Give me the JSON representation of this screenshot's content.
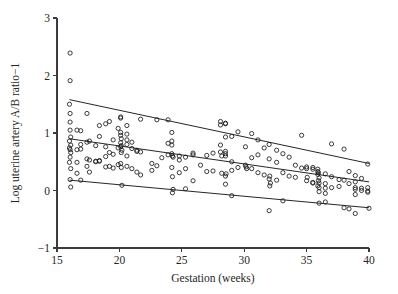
{
  "chart_data": {
    "type": "scatter",
    "title": "",
    "xlabel": "Gestation (weeks)",
    "ylabel": "Log uterine artery A/B ratio−1",
    "xlim": [
      15,
      40
    ],
    "ylim": [
      -1,
      3
    ],
    "xticks": [
      15,
      20,
      25,
      30,
      35,
      40
    ],
    "yticks": [
      -1,
      0,
      1,
      2,
      3
    ],
    "xtick_labels": [
      "15",
      "20",
      "25",
      "30",
      "35",
      "40"
    ],
    "ytick_labels": [
      "−1",
      "0",
      "1",
      "2",
      "3"
    ],
    "grid": false,
    "legend": null,
    "marker": "open-circle",
    "marker_color": "#1a1a1a",
    "line_color": "#1a1a1a",
    "reference_lines": [
      {
        "name": "upper-centile-line",
        "x": [
          16.0,
          40.0
        ],
        "y": [
          1.58,
          0.47
        ]
      },
      {
        "name": "median-line",
        "x": [
          16.0,
          40.0
        ],
        "y": [
          0.9,
          0.15
        ]
      },
      {
        "name": "lower-centile-line",
        "x": [
          16.0,
          40.0
        ],
        "y": [
          0.18,
          -0.3
        ]
      }
    ],
    "points": [
      [
        16.05,
        2.39
      ],
      [
        16.05,
        1.91
      ],
      [
        16.0,
        1.5
      ],
      [
        16.05,
        1.34
      ],
      [
        16.05,
        1.19
      ],
      [
        16.05,
        1.05
      ],
      [
        16.1,
        0.93
      ],
      [
        16.0,
        0.86
      ],
      [
        16.1,
        0.79
      ],
      [
        16.0,
        0.74
      ],
      [
        16.05,
        0.71
      ],
      [
        16.1,
        0.66
      ],
      [
        16.05,
        0.58
      ],
      [
        16.0,
        0.49
      ],
      [
        16.1,
        0.38
      ],
      [
        16.05,
        0.19
      ],
      [
        16.1,
        0.06
      ],
      [
        16.6,
        1.05
      ],
      [
        16.6,
        0.71
      ],
      [
        16.6,
        0.49
      ],
      [
        16.6,
        0.3
      ],
      [
        16.9,
        1.04
      ],
      [
        16.9,
        0.8
      ],
      [
        16.9,
        0.72
      ],
      [
        16.9,
        0.18
      ],
      [
        17.4,
        1.34
      ],
      [
        17.4,
        0.84
      ],
      [
        17.4,
        0.55
      ],
      [
        17.4,
        0.42
      ],
      [
        17.6,
        0.86
      ],
      [
        17.6,
        0.53
      ],
      [
        17.6,
        0.32
      ],
      [
        18.1,
        0.78
      ],
      [
        18.1,
        0.51
      ],
      [
        18.1,
        0.5
      ],
      [
        18.4,
        1.13
      ],
      [
        18.4,
        0.94
      ],
      [
        18.4,
        0.52
      ],
      [
        18.4,
        0.51
      ],
      [
        18.9,
        1.16
      ],
      [
        18.9,
        0.76
      ],
      [
        18.9,
        0.59
      ],
      [
        18.9,
        0.41
      ],
      [
        19.2,
        1.2
      ],
      [
        19.2,
        0.66
      ],
      [
        19.2,
        0.42
      ],
      [
        19.5,
        0.88
      ],
      [
        19.5,
        0.63
      ],
      [
        19.5,
        0.39
      ],
      [
        19.9,
        1.08
      ],
      [
        19.9,
        0.74
      ],
      [
        19.9,
        0.45
      ],
      [
        20.1,
        1.28
      ],
      [
        20.1,
        1.26
      ],
      [
        20.1,
        1.01
      ],
      [
        20.1,
        0.96
      ],
      [
        20.15,
        0.9
      ],
      [
        20.1,
        0.83
      ],
      [
        20.15,
        0.78
      ],
      [
        20.1,
        0.76
      ],
      [
        20.2,
        0.7
      ],
      [
        20.15,
        0.66
      ],
      [
        20.1,
        0.47
      ],
      [
        20.15,
        0.4
      ],
      [
        20.2,
        0.09
      ],
      [
        20.6,
        1.13
      ],
      [
        20.6,
        0.98
      ],
      [
        20.6,
        0.88
      ],
      [
        20.6,
        0.8
      ],
      [
        20.6,
        0.6
      ],
      [
        20.6,
        0.42
      ],
      [
        21.0,
        0.84
      ],
      [
        21.0,
        0.73
      ],
      [
        21.0,
        0.38
      ],
      [
        21.4,
        0.7
      ],
      [
        21.4,
        0.68
      ],
      [
        21.4,
        0.32
      ],
      [
        21.7,
        1.24
      ],
      [
        21.7,
        0.67
      ],
      [
        21.7,
        0.27
      ],
      [
        22.6,
        0.47
      ],
      [
        22.6,
        0.35
      ],
      [
        23.0,
        1.23
      ],
      [
        23.0,
        0.43
      ],
      [
        23.4,
        0.57
      ],
      [
        23.9,
        1.23
      ],
      [
        23.9,
        0.82
      ],
      [
        23.9,
        0.62
      ],
      [
        24.2,
        1.01
      ],
      [
        24.2,
        0.86
      ],
      [
        24.2,
        0.79
      ],
      [
        24.2,
        0.64
      ],
      [
        24.25,
        0.6
      ],
      [
        24.3,
        0.58
      ],
      [
        24.2,
        0.4
      ],
      [
        24.25,
        0.24
      ],
      [
        24.3,
        0.02
      ],
      [
        24.25,
        -0.04
      ],
      [
        24.8,
        0.6
      ],
      [
        24.8,
        0.53
      ],
      [
        24.8,
        0.31
      ],
      [
        25.3,
        0.58
      ],
      [
        25.3,
        0.38
      ],
      [
        25.3,
        0.03
      ],
      [
        25.9,
        0.65
      ],
      [
        25.9,
        0.62
      ],
      [
        25.9,
        0.17
      ],
      [
        26.5,
        0.44
      ],
      [
        27.0,
        0.61
      ],
      [
        27.0,
        0.33
      ],
      [
        27.5,
        0.65
      ],
      [
        27.5,
        0.34
      ],
      [
        28.1,
        1.2
      ],
      [
        28.1,
        1.14
      ],
      [
        28.1,
        0.79
      ],
      [
        28.1,
        0.67
      ],
      [
        28.2,
        0.6
      ],
      [
        28.2,
        0.3
      ],
      [
        28.5,
        1.17
      ],
      [
        28.5,
        1.16
      ],
      [
        28.5,
        0.93
      ],
      [
        28.5,
        0.68
      ],
      [
        28.5,
        0.64
      ],
      [
        28.5,
        0.6
      ],
      [
        28.55,
        0.29
      ],
      [
        28.5,
        0.25
      ],
      [
        28.5,
        0.11
      ],
      [
        29.0,
        0.94
      ],
      [
        29.0,
        0.5
      ],
      [
        29.0,
        0.35
      ],
      [
        29.0,
        -0.09
      ],
      [
        29.5,
        1.02
      ],
      [
        29.5,
        0.4
      ],
      [
        30.1,
        0.76
      ],
      [
        30.1,
        0.44
      ],
      [
        30.15,
        0.41
      ],
      [
        30.2,
        0.38
      ],
      [
        30.6,
        0.99
      ],
      [
        30.6,
        0.57
      ],
      [
        30.6,
        0.38
      ],
      [
        31.1,
        0.88
      ],
      [
        31.1,
        0.62
      ],
      [
        31.1,
        0.31
      ],
      [
        31.6,
        0.74
      ],
      [
        31.6,
        0.27
      ],
      [
        32.0,
        0.8
      ],
      [
        32.0,
        0.55
      ],
      [
        32.05,
        0.25
      ],
      [
        32.0,
        0.2
      ],
      [
        32.1,
        0.13
      ],
      [
        32.05,
        0.08
      ],
      [
        32.0,
        -0.35
      ],
      [
        32.6,
        0.7
      ],
      [
        32.6,
        0.49
      ],
      [
        32.6,
        0.18
      ],
      [
        33.1,
        0.64
      ],
      [
        33.1,
        0.31
      ],
      [
        33.1,
        -0.18
      ],
      [
        33.6,
        0.58
      ],
      [
        33.6,
        0.25
      ],
      [
        34.1,
        0.44
      ],
      [
        34.1,
        0.23
      ],
      [
        34.6,
        0.96
      ],
      [
        34.6,
        0.39
      ],
      [
        35.0,
        0.41
      ],
      [
        35.0,
        0.38
      ],
      [
        35.05,
        0.23
      ],
      [
        35.0,
        0.17
      ],
      [
        35.5,
        0.4
      ],
      [
        35.5,
        0.37
      ],
      [
        35.5,
        0.14
      ],
      [
        35.5,
        0.13
      ],
      [
        35.9,
        0.37
      ],
      [
        35.9,
        0.33
      ],
      [
        35.95,
        0.31
      ],
      [
        35.9,
        0.28
      ],
      [
        36.0,
        0.22
      ],
      [
        35.95,
        0.17
      ],
      [
        36.0,
        0.13
      ],
      [
        35.9,
        0.08
      ],
      [
        36.0,
        0.05
      ],
      [
        36.0,
        -0.02
      ],
      [
        36.0,
        -0.22
      ],
      [
        36.5,
        0.29
      ],
      [
        36.5,
        0.12
      ],
      [
        36.5,
        0.04
      ],
      [
        36.5,
        -0.05
      ],
      [
        36.5,
        -0.2
      ],
      [
        37.0,
        0.81
      ],
      [
        37.0,
        0.24
      ],
      [
        37.0,
        0.05
      ],
      [
        37.6,
        0.19
      ],
      [
        37.6,
        0.07
      ],
      [
        38.0,
        0.72
      ],
      [
        38.0,
        0.18
      ],
      [
        38.0,
        -0.3
      ],
      [
        38.4,
        0.33
      ],
      [
        38.4,
        0.12
      ],
      [
        38.4,
        -0.32
      ],
      [
        38.9,
        0.26
      ],
      [
        38.9,
        0.15
      ],
      [
        38.9,
        0.05
      ],
      [
        38.9,
        0.02
      ],
      [
        38.9,
        -0.07
      ],
      [
        38.9,
        -0.4
      ],
      [
        39.4,
        0.21
      ],
      [
        39.4,
        0.04
      ],
      [
        39.4,
        0.0
      ],
      [
        39.9,
        0.46
      ],
      [
        39.9,
        0.05
      ],
      [
        39.9,
        -0.01
      ],
      [
        39.9,
        -0.03
      ],
      [
        40.0,
        -0.31
      ]
    ]
  }
}
